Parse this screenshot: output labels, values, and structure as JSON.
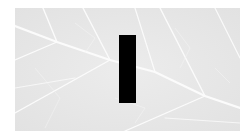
{
  "image": {
    "subject": "leaf-vein-texture",
    "style": "grayscale",
    "colors": {
      "background": "#ffffff",
      "leaf": "#e9e9e9",
      "vein": "#fafafa",
      "bar": "#000000"
    }
  },
  "overlay": {
    "shape": "vertical-bar",
    "color": "#000000"
  }
}
